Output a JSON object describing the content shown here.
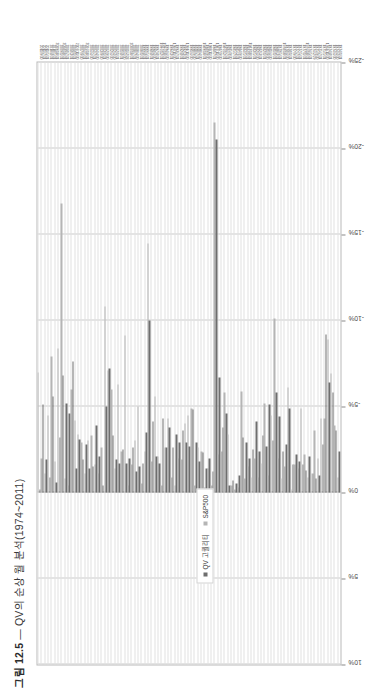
{
  "figure": {
    "number": "그림 12.5",
    "dash": "—",
    "title": "QV의 순상 월 분석(1974~2011)"
  },
  "legend": {
    "position": "inside-left",
    "items": [
      {
        "label": "QV 고퀄리티",
        "color": "#6e6e6e",
        "marker": "square"
      },
      {
        "label": "S&P500",
        "color": "#b5b5b5",
        "marker": "square"
      }
    ]
  },
  "chart_data": {
    "type": "bar",
    "orientation": "horizontal",
    "title": "QV의 순상 월 분석(1974~2011)",
    "xlabel": "",
    "ylabel": "",
    "xlim": [
      10,
      -25
    ],
    "grid": true,
    "axis_ticks": [
      "10%",
      "5%",
      "0%",
      "-5%",
      "-10%",
      "-15%",
      "-20%",
      "-25%"
    ],
    "axis_tick_values": [
      10,
      5,
      0,
      -5,
      -10,
      -15,
      -20,
      -25
    ],
    "categories": [
      "2011/9/30",
      "2011/7/31",
      "2011/5/31",
      "2010/8/31",
      "2010/5/31",
      "2009/10/31",
      "2009/1/31",
      "2008/10/31",
      "2008/7/31",
      "2008/3/31",
      "2008/1/31",
      "2007/11/30",
      "2007/9/30",
      "2006/5/31",
      "2006/10/31",
      "2006/4/30",
      "2004/7/31",
      "2004/4/30",
      "2003/9/30",
      "2003/1/31",
      "2002/9/30",
      "2002/6/30",
      "2002/4/30",
      "2002/1/31",
      "2001/8/31",
      "2001/6/30",
      "2001/2/28",
      "2000/10/31",
      "2000/7/31",
      "2000/4/30",
      "2000/1/31",
      "1999/8/31",
      "1999/5/31",
      "1998/8/31",
      "1998/4/30",
      "1997/8/31",
      "1996/12/31",
      "1996/10/31",
      "1994/6/30",
      "1994/3/31",
      "1993/11/30",
      "1993/7/31",
      "1992/8/31",
      "1992/3/31",
      "1991/11/30",
      "1991/6/30",
      "1990/9/30",
      "1990/7/31",
      "1990/4/30",
      "1989/10/31",
      "1989/9/30",
      "1988/11/30",
      "1988/7/31",
      "1987/11/30",
      "1987/9/30",
      "1986/12/31",
      "1986/7/31",
      "1985/9/30",
      "1985/7/31",
      "1985/3/31",
      "1984/9/30",
      "1984/5/31",
      "1984/1/31",
      "1983/10/31",
      "1983/5/31",
      "1982/6/30",
      "1982/3/31",
      "1982/1/31",
      "1981/9/30",
      "1981/6/30",
      "1981/1/31",
      "1980/3/31",
      "1979/5/31",
      "1978/10/31",
      "1978/6/30",
      "1978/1/31",
      "1977/9/30",
      "1977/7/31",
      "1977/5/31",
      "1977/1/31",
      "1976/10/31",
      "1976/5/31",
      "1976/2/29",
      "1975/9/30",
      "1975/7/31",
      "1975/5/31",
      "1974/11/30",
      "1974/8/31",
      "1974/6/30",
      "1974/4/30",
      "1974/1/31"
    ],
    "series": [
      {
        "name": "QV 고퀄리티",
        "color": "#6e6e6e",
        "values": [
          -0.2,
          -5.1,
          -1.9,
          -0.9,
          -5.6,
          -0.6,
          -3.2,
          -6.8,
          -5.2,
          -4.6,
          -7.6,
          -1.4,
          -3.1,
          -1.9,
          -2.8,
          -1.4,
          -1.5,
          -3.9,
          -2.1,
          -0.4,
          -5.0,
          -7.2,
          -3.3,
          -1.9,
          -1.7,
          -2.5,
          -1.7,
          -2.0,
          -2.6,
          -1.2,
          -1.5,
          -1.7,
          -3.5,
          -10.0,
          -4.1,
          -2.1,
          -1.7,
          -4.3,
          -2.6,
          -3.8,
          -2.6,
          -3.4,
          -2.9,
          -3.6,
          -2.9,
          -2.7,
          -4.8,
          -2.9,
          -1.8,
          -2.3,
          -1.4,
          -2.0,
          -1.2,
          -20.5,
          -6.7,
          -3.8,
          -4.6,
          -0.4,
          -0.7,
          -0.5,
          -1.0,
          -3.2,
          -2.9,
          -2.0,
          -2.5,
          -4.1,
          -2.4,
          -3.3,
          -2.7,
          -5.1,
          -3.0,
          -5.8,
          -4.4,
          -2.4,
          -2.8,
          -4.9,
          -1.6,
          -2.2,
          -1.8,
          -1.6,
          -1.3,
          -2.1,
          -1.1,
          -0.8,
          -1.0,
          -2.8,
          -9.2,
          -6.4,
          -5.8,
          -3.6,
          -2.4
        ]
      },
      {
        "name": "S&P500",
        "color": "#b5b5b5",
        "values": [
          -7.0,
          -2.0,
          -1.1,
          -4.5,
          -7.9,
          -1.8,
          -8.4,
          -16.8,
          -0.8,
          -0.4,
          -6.0,
          -4.2,
          -3.4,
          -2.9,
          -1.1,
          -3.0,
          -3.3,
          -1.6,
          -1.1,
          -2.6,
          -10.8,
          -7.1,
          -6.0,
          -1.4,
          -6.3,
          -2.4,
          -9.1,
          -0.4,
          -1.6,
          -3.0,
          -5.0,
          -0.5,
          -2.4,
          -14.5,
          -1.8,
          -5.6,
          -2.1,
          -0.4,
          -2.6,
          -4.3,
          -0.9,
          -0.4,
          -2.0,
          -1.9,
          -4.0,
          -4.5,
          -4.9,
          -0.4,
          -2.6,
          -2.4,
          -0.3,
          -1.4,
          -0.4,
          -21.5,
          -2.2,
          -2.4,
          -5.8,
          -3.4,
          -0.4,
          -0.2,
          -0.3,
          -5.9,
          -0.8,
          -1.5,
          -0.9,
          -2.0,
          -0.9,
          -1.7,
          -5.2,
          -1.0,
          -4.5,
          -10.1,
          -2.0,
          -0.8,
          -1.5,
          -6.1,
          -0.2,
          -1.6,
          -1.4,
          -4.9,
          -2.2,
          -0.9,
          -1.1,
          -3.6,
          -2.0,
          -4.3,
          -4.3,
          -8.9,
          -6.9,
          -3.9,
          -0.9
        ]
      }
    ]
  }
}
